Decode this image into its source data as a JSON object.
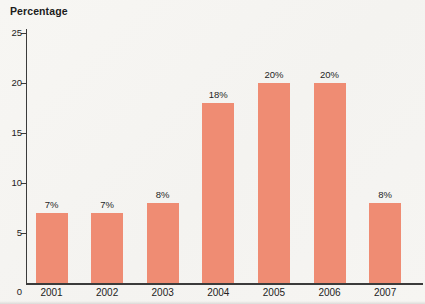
{
  "chart_data": {
    "type": "bar",
    "title": "Percentage",
    "ylabel": "Percentage",
    "xlabel": "",
    "categories": [
      "2001",
      "2002",
      "2003",
      "2004",
      "2005",
      "2006",
      "2007"
    ],
    "values": [
      7,
      7,
      8,
      18,
      20,
      20,
      8
    ],
    "value_labels": [
      "7%",
      "7%",
      "8%",
      "18%",
      "20%",
      "20%",
      "8%"
    ],
    "ylim": [
      0,
      25
    ],
    "yticks": [
      0,
      5,
      10,
      15,
      20,
      25
    ],
    "grid": false,
    "legend": "none",
    "bar_color": "#ef8c73",
    "axis_color": "#3b3b3b",
    "text_color": "#222222",
    "background_color": "#f6f5f2"
  }
}
